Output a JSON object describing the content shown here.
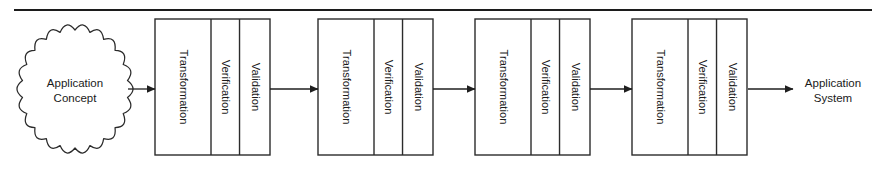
{
  "diagram": {
    "type": "flow-pipeline",
    "background_color": "#ffffff",
    "line_color": "#2b2b2b",
    "top_rule": {
      "name": "header-rule",
      "x1": 14,
      "x2": 872,
      "y": 10
    },
    "start_node": {
      "shape": "cloud",
      "line1": "Application",
      "line2": "Concept",
      "cx": 75,
      "cy": 89,
      "rx": 53,
      "ry": 59
    },
    "end_node": {
      "shape": "text",
      "line1": "Application",
      "line2": "System",
      "cx": 833,
      "cy": 89
    },
    "stage_cells": [
      "Transformation",
      "Verification",
      "Validation"
    ],
    "stages": [
      {
        "name": "stage-1",
        "x": 155,
        "width": 115,
        "cells": [
          "Transformation",
          "Verification",
          "Validation"
        ]
      },
      {
        "name": "stage-2",
        "x": 318,
        "width": 115,
        "cells": [
          "Transformation",
          "Verification",
          "Validation"
        ]
      },
      {
        "name": "stage-3",
        "x": 475,
        "width": 115,
        "cells": [
          "Transformation",
          "Verification",
          "Validation"
        ]
      },
      {
        "name": "stage-4",
        "x": 632,
        "width": 115,
        "cells": [
          "Transformation",
          "Verification",
          "Validation"
        ]
      }
    ],
    "stage_box": {
      "y": 19,
      "height": 136,
      "cell_split_1": 0.487,
      "cell_split_2": 0.735
    },
    "connectors": [
      {
        "name": "connector-concept-to-stage-1",
        "x1": 128,
        "x2": 155,
        "y": 89
      },
      {
        "name": "connector-stage-1-to-stage-2",
        "x1": 270,
        "x2": 318,
        "y": 89
      },
      {
        "name": "connector-stage-2-to-stage-3",
        "x1": 433,
        "x2": 475,
        "y": 89
      },
      {
        "name": "connector-stage-3-to-stage-4",
        "x1": 590,
        "x2": 632,
        "y": 89
      },
      {
        "name": "connector-stage-4-to-system",
        "x1": 748,
        "x2": 793,
        "y": 89
      }
    ]
  }
}
